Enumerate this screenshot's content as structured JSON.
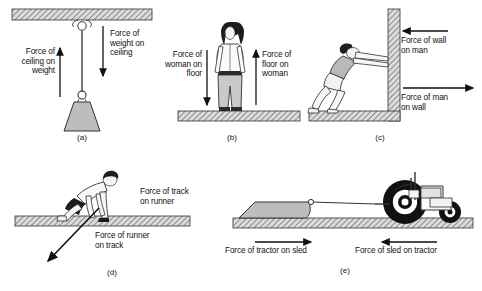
{
  "figure": {
    "panels": [
      {
        "id": "a",
        "label": "(a)",
        "scene": "weight-hanging-from-ceiling",
        "labels": [
          {
            "name": "force-ceiling-on-weight",
            "text": "Force of\nceiling on\nweight",
            "arrow": "up"
          },
          {
            "name": "force-weight-on-ceiling",
            "text": "Force of\nweight on\nceiling",
            "arrow": "down"
          }
        ]
      },
      {
        "id": "b",
        "label": "(b)",
        "scene": "woman-standing-on-floor",
        "labels": [
          {
            "name": "force-woman-on-floor",
            "text": "Force of\nwoman on\nfloor",
            "arrow": "down"
          },
          {
            "name": "force-floor-on-woman",
            "text": "Force of\nfloor on\nwoman",
            "arrow": "up"
          }
        ]
      },
      {
        "id": "c",
        "label": "(c)",
        "scene": "man-pushing-wall",
        "labels": [
          {
            "name": "force-wall-on-man",
            "text": "Force of wall\non man",
            "arrow": "left"
          },
          {
            "name": "force-man-on-wall",
            "text": "Force of man\non wall",
            "arrow": "right"
          }
        ]
      },
      {
        "id": "d",
        "label": "(d)",
        "scene": "runner-pushing-track",
        "labels": [
          {
            "name": "force-track-on-runner",
            "text": "Force of track\non runner",
            "arrow": "none"
          },
          {
            "name": "force-runner-on-track",
            "text": "Force of runner\non track",
            "arrow": "diagonal-down-left"
          }
        ]
      },
      {
        "id": "e",
        "label": "(e)",
        "scene": "tractor-pulling-sled",
        "labels": [
          {
            "name": "force-tractor-on-sled",
            "text": "Force  of tractor on sled",
            "arrow": "right"
          },
          {
            "name": "force-sled-on-tractor",
            "text": "Force of sled on tractor",
            "arrow": "left"
          }
        ]
      }
    ]
  },
  "colors": {
    "ink": "#111111",
    "hatch_fill": "#d9d9d9",
    "hatch_line": "#555555",
    "body_gray": "#b5b5b5",
    "skin": "#f2f2f2",
    "dark": "#1a1a1a"
  }
}
